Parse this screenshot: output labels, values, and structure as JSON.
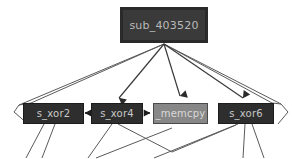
{
  "graph": {
    "title": "call-graph",
    "background_color": "#ffffff",
    "edge_color": "#5a5a5a",
    "nodes": [
      {
        "id": "root",
        "label": "sub_403520",
        "kind": "function",
        "fill": "#3a3a3a",
        "border": "#2a2a2a",
        "text_color": "#b9b9b9",
        "x": 120,
        "y": 7,
        "w": 88,
        "h": 36
      },
      {
        "id": "xor2",
        "label": "s_xor2",
        "kind": "function",
        "fill": "#2e2e2e",
        "border": "#1c1c1c",
        "text_color": "#c8c8c8",
        "x": 23,
        "y": 103,
        "w": 61,
        "h": 21
      },
      {
        "id": "xor4",
        "label": "s_xor4",
        "kind": "function",
        "fill": "#2e2e2e",
        "border": "#1c1c1c",
        "text_color": "#c8c8c8",
        "x": 91,
        "y": 103,
        "w": 52,
        "h": 21
      },
      {
        "id": "memcpy",
        "label": "_memcpy",
        "kind": "library-function",
        "fill": "#878787",
        "border": "#4a4a4a",
        "text_color": "#d8d8d8",
        "x": 153,
        "y": 103,
        "w": 55,
        "h": 21
      },
      {
        "id": "xor6",
        "label": "s_xor6",
        "kind": "function",
        "fill": "#2e2e2e",
        "border": "#1c1c1c",
        "text_color": "#c8c8c8",
        "x": 218,
        "y": 103,
        "w": 56,
        "h": 21
      }
    ],
    "edges": [
      {
        "from": "root",
        "to": "xor2",
        "arrowhead": false,
        "points": "164,43 30,104"
      },
      {
        "from": "root",
        "to": "xor4",
        "arrowhead": true,
        "points": "164,43 118,100"
      },
      {
        "from": "root",
        "to": "memcpy",
        "arrowhead": true,
        "points": "164,43 180,98"
      },
      {
        "from": "root",
        "to": "xor6",
        "arrowhead": true,
        "points": "164,43 242,100"
      },
      {
        "from": "root",
        "to": "far-right",
        "arrowhead": false,
        "points": "164,43 283,104"
      },
      {
        "from": "xor4",
        "to": "xor2",
        "arrowhead": true,
        "points": "91,113 86,113"
      },
      {
        "from": "xor4",
        "to": "memcpy",
        "arrowhead": true,
        "points": "143,113 151,113"
      }
    ]
  }
}
